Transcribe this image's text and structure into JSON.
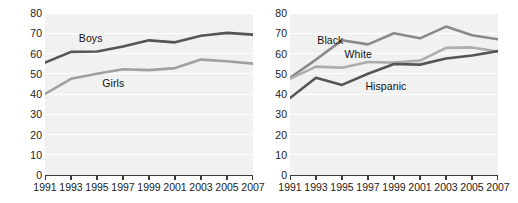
{
  "figure": {
    "background": "#ffffff",
    "plot_background": "#f1f1f1",
    "gridline_color": "#ffffff",
    "axis_color": "#3a3a3a"
  },
  "chart_data": [
    {
      "type": "line",
      "panel": "left",
      "title": "",
      "xlabel": "",
      "ylabel": "Percent",
      "x": [
        1991,
        1993,
        1995,
        1997,
        1999,
        2001,
        2003,
        2005,
        2007
      ],
      "xticklabels": [
        "1991",
        "1993",
        "1995",
        "1997",
        "1999",
        "2001",
        "2003",
        "2005",
        "2007"
      ],
      "yticks": [
        0,
        10,
        20,
        30,
        40,
        50,
        60,
        70,
        80
      ],
      "yticklabels": [
        "0",
        "10",
        "20",
        "30",
        "40",
        "50",
        "60",
        "70",
        "80"
      ],
      "ylim": [
        0,
        80
      ],
      "grid": true,
      "legend": "inline-labels",
      "series": [
        {
          "name": "Boys",
          "color": "#555555",
          "values": [
            55.5,
            60.8,
            61.0,
            63.5,
            66.5,
            65.5,
            68.8,
            70.2,
            69.3
          ],
          "label_x": 1993.6,
          "label_y": 67.5
        },
        {
          "name": "Girls",
          "color": "#a0a0a0",
          "values": [
            40.0,
            47.5,
            50.0,
            52.2,
            51.8,
            52.8,
            57.0,
            56.2,
            55.0
          ],
          "label_x": 1995.4,
          "label_y": 45.5
        }
      ]
    },
    {
      "type": "line",
      "panel": "right",
      "title": "",
      "xlabel": "",
      "ylabel": "",
      "x": [
        1991,
        1993,
        1995,
        1997,
        1999,
        2001,
        2003,
        2005,
        2007
      ],
      "xticklabels": [
        "1991",
        "1993",
        "1995",
        "1997",
        "1999",
        "2001",
        "2003",
        "2005",
        "2007"
      ],
      "yticks": [
        0,
        10,
        20,
        30,
        40,
        50,
        60,
        70,
        80
      ],
      "yticklabels": [
        "0",
        "10",
        "20",
        "30",
        "40",
        "50",
        "60",
        "70",
        "80"
      ],
      "ylim": [
        0,
        80
      ],
      "grid": true,
      "legend": "inline-labels",
      "series": [
        {
          "name": "Black",
          "color": "#8a8a8a",
          "values": [
            48.0,
            57.0,
            66.5,
            64.5,
            70.0,
            67.5,
            73.3,
            69.0,
            67.0
          ],
          "label_x": 1993.1,
          "label_y": 66.5
        },
        {
          "name": "White",
          "color": "#adadad",
          "values": [
            47.5,
            53.5,
            53.0,
            55.8,
            55.5,
            56.5,
            62.8,
            63.0,
            61.0
          ],
          "label_x": 1995.2,
          "label_y": 60.0
        },
        {
          "name": "Hispanic",
          "color": "#555555",
          "values": [
            38.0,
            48.0,
            44.5,
            50.0,
            54.8,
            54.5,
            57.5,
            59.0,
            61.2
          ],
          "label_x": 1996.8,
          "label_y": 44.0
        }
      ]
    }
  ]
}
